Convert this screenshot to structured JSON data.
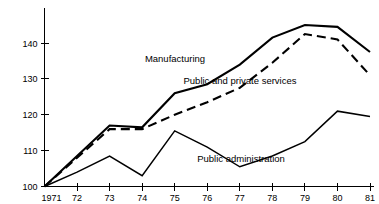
{
  "chart_data": {
    "type": "line",
    "title": "",
    "subtitle": "",
    "xlabel": "",
    "ylabel": "",
    "x": [
      1971,
      1972,
      1973,
      1974,
      1975,
      1976,
      1977,
      1978,
      1979,
      1980,
      1981
    ],
    "x_tick_labels": [
      "1971",
      "72",
      "73",
      "74",
      "75",
      "76",
      "77",
      "78",
      "79",
      "80",
      "81"
    ],
    "y_tick_labels": [
      "100",
      "110",
      "120",
      "130",
      "140"
    ],
    "y_ticks": [
      100,
      110,
      120,
      130,
      140
    ],
    "xlim": [
      1971,
      1981
    ],
    "ylim": [
      100,
      146
    ],
    "grid": false,
    "legend": "inline-annotations",
    "series": [
      {
        "name": "Manufacturing",
        "style": "solid",
        "values": [
          100,
          108.5,
          117,
          116.5,
          126,
          128.5,
          134,
          141.5,
          145,
          144.5,
          137.5
        ],
        "label": "Manufacturing",
        "label_x": 175,
        "label_y": 62
      },
      {
        "name": "Public and private services",
        "style": "dashed",
        "values": [
          100,
          108,
          116,
          116,
          120,
          123.5,
          127.5,
          134.5,
          142.5,
          141,
          131
        ],
        "label": "Public and private services",
        "label_x": 240,
        "label_y": 84
      },
      {
        "name": "Public administration",
        "style": "solid-thin",
        "values": [
          100,
          104,
          108.5,
          103,
          115.5,
          111,
          105.5,
          108.5,
          112.5,
          121,
          119.5
        ],
        "label": "Public administration",
        "label_x": 241,
        "label_y": 162
      }
    ]
  },
  "axes": {
    "y_axis_name": "value-axis",
    "x_axis_name": "year-axis"
  }
}
